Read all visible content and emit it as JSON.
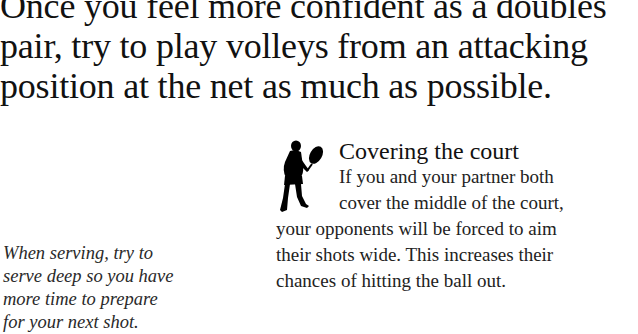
{
  "lead_paragraph": {
    "lines": [
      "Once you feel more confident as a doubles",
      "pair, try to play volleys from an attacking",
      "position at the net as much as possible."
    ]
  },
  "caption": {
    "lines": [
      "When serving, try to",
      "serve deep so you have",
      "more time to prepare",
      "for your next shot."
    ]
  },
  "section": {
    "icon": "tennis-player-silhouette-icon",
    "title": "Covering the court",
    "body_lines": [
      "If you and your partner both",
      "cover the middle of the court,",
      "your opponents will be forced to aim",
      "their shots wide. This increases their",
      "chances of hitting the ball out."
    ]
  }
}
